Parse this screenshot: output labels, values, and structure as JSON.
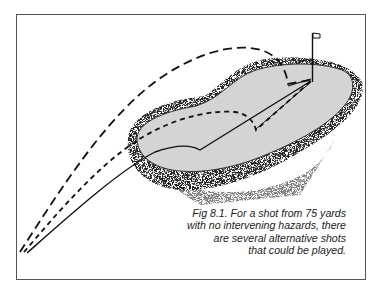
{
  "figure": {
    "label": "Fig 8.1.",
    "caption_lines": [
      "Fig 8.1. For a shot from 75 yards",
      "with no intervening hazards, there",
      "are several alternative shots",
      "that could be played."
    ],
    "elements": {
      "green": "putting green (light gray fill)",
      "rough": "stippled rough surrounding green",
      "flag": "flagstick with pennant",
      "shots": [
        {
          "name": "high-pitch",
          "style": "long-dash"
        },
        {
          "name": "pitch-and-run",
          "style": "short-dash"
        },
        {
          "name": "chip-and-run",
          "style": "solid"
        }
      ]
    },
    "colors": {
      "green_fill": "#d4d4d4",
      "line": "#111111",
      "frame": "#555555"
    }
  }
}
